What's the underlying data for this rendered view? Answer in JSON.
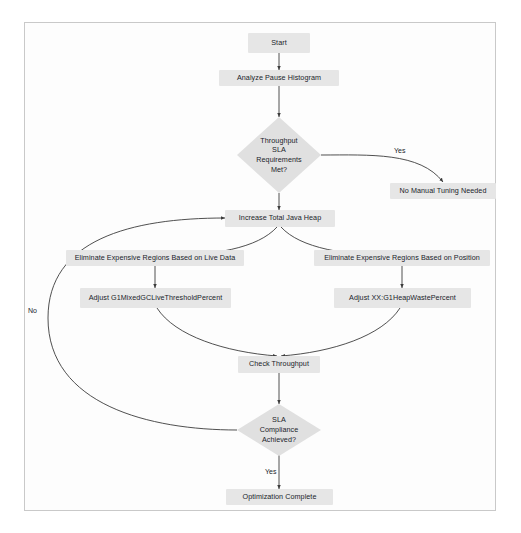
{
  "diagram": {
    "background_color": "#ffffff",
    "frame_border_color": "#c9c9c9",
    "node_fill_color": "#e6e6e6",
    "decision_fill_color": "#e0e0e0",
    "edge_color": "#3c3c3c",
    "text_color": "#20232a",
    "nodes": [
      {
        "id": "start",
        "type": "process",
        "label": "Start"
      },
      {
        "id": "analyze",
        "type": "process",
        "label": "Analyze Pause Histogram"
      },
      {
        "id": "throughput_sla",
        "type": "decision",
        "label": "Throughput\nSLA\nRequirements\nMet?"
      },
      {
        "id": "no_tuning",
        "type": "process",
        "label": "No Manual Tuning Needed"
      },
      {
        "id": "increase_heap",
        "type": "process",
        "label": "Increase Total Java Heap"
      },
      {
        "id": "elim_live_data",
        "type": "process",
        "label": "Eliminate Expensive Regions Based on Live Data"
      },
      {
        "id": "adjust_mixedgc",
        "type": "process",
        "label": "Adjust G1MixedGCLiveThresholdPercent"
      },
      {
        "id": "elim_position",
        "type": "process",
        "label": "Eliminate Expensive Regions Based on Position"
      },
      {
        "id": "adjust_heapwaste",
        "type": "process",
        "label": "Adjust XX:G1HeapWastePercent"
      },
      {
        "id": "check_throughput",
        "type": "process",
        "label": "Check Throughput"
      },
      {
        "id": "sla_compliance",
        "type": "decision",
        "label": "SLA\nCompliance\nAchieved?"
      },
      {
        "id": "optimization_done",
        "type": "process",
        "label": "Optimization Complete"
      }
    ],
    "edge_labels": {
      "throughput_yes": "Yes",
      "sla_no": "No",
      "sla_yes": "Yes"
    },
    "edges": [
      {
        "from": "start",
        "to": "analyze",
        "label": ""
      },
      {
        "from": "analyze",
        "to": "throughput_sla",
        "label": ""
      },
      {
        "from": "throughput_sla",
        "to": "no_tuning",
        "label": "Yes"
      },
      {
        "from": "throughput_sla",
        "to": "increase_heap",
        "label": ""
      },
      {
        "from": "increase_heap",
        "to": "elim_live_data",
        "label": ""
      },
      {
        "from": "increase_heap",
        "to": "elim_position",
        "label": ""
      },
      {
        "from": "elim_live_data",
        "to": "adjust_mixedgc",
        "label": ""
      },
      {
        "from": "elim_position",
        "to": "adjust_heapwaste",
        "label": ""
      },
      {
        "from": "adjust_mixedgc",
        "to": "check_throughput",
        "label": ""
      },
      {
        "from": "adjust_heapwaste",
        "to": "check_throughput",
        "label": ""
      },
      {
        "from": "check_throughput",
        "to": "sla_compliance",
        "label": ""
      },
      {
        "from": "sla_compliance",
        "to": "increase_heap",
        "label": "No"
      },
      {
        "from": "sla_compliance",
        "to": "optimization_done",
        "label": "Yes"
      }
    ]
  }
}
